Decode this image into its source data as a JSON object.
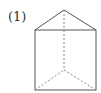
{
  "figure": {
    "label": "(1)",
    "shape": "triangular-prism",
    "colors": {
      "solid_edge": "#555555",
      "hidden_edge": "#888888"
    },
    "vertices": {
      "apex_top": [
        64,
        10
      ],
      "front_top_left": [
        35,
        30
      ],
      "front_top_right": [
        96,
        30
      ],
      "front_bottom_left": [
        35,
        90
      ],
      "front_bottom_right": [
        96,
        90
      ],
      "back_bottom": [
        64,
        70
      ]
    }
  }
}
